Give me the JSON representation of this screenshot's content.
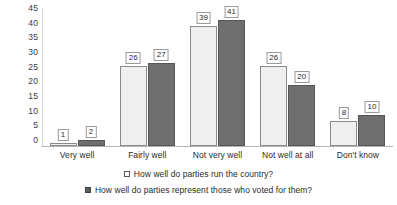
{
  "chart_data": {
    "type": "bar",
    "title": "",
    "subtitle": "",
    "xlabel": "",
    "ylabel": "",
    "ylim": [
      0,
      45
    ],
    "ytick_step": 5,
    "yticks": [
      "45",
      "40",
      "35",
      "30",
      "25",
      "20",
      "15",
      "10",
      "5",
      "0"
    ],
    "grid": false,
    "legend_position": "bottom",
    "categories": [
      "Very well",
      "Fairly well",
      "Not very well",
      "Not well at all",
      "Don't know"
    ],
    "series": [
      {
        "name": "How well do parties run the country?",
        "marker": "open-square",
        "color": "#efefef",
        "border_color": "#8a8a8a",
        "values": [
          1,
          26,
          39,
          26,
          8
        ]
      },
      {
        "name": "How well do parties represent those who voted for them?",
        "marker": "filled-square",
        "color": "#6f6f6f",
        "border_color": "#565656",
        "values": [
          2,
          27,
          41,
          20,
          10
        ]
      }
    ]
  },
  "axis": {
    "baseline_color": "#b4b4b4",
    "y_axis_color": "#d4d4d4"
  }
}
